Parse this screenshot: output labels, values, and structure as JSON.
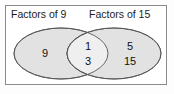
{
  "diagram": {
    "type": "venn-diagram",
    "title": "",
    "frame_border_color": "#8a8a8a",
    "background_color": "#ffffff",
    "sets": [
      {
        "id": "left",
        "label": "Factors of 9",
        "fill_color": "#e2e2e2",
        "stroke_color": "#555555",
        "exclusive_members": [
          "9"
        ]
      },
      {
        "id": "right",
        "label": "Factors of 15",
        "fill_color": "#e2e2e2",
        "stroke_color": "#555555",
        "exclusive_members": [
          "5",
          "15"
        ]
      }
    ],
    "intersection": {
      "fill_color": "#efefef",
      "members": [
        "1",
        "3"
      ]
    }
  },
  "regions": {
    "left_only": {
      "values": [
        "9"
      ],
      "positions": [
        {
          "x": 45,
          "y": 54
        }
      ]
    },
    "intersection": {
      "values": [
        "1",
        "3"
      ],
      "positions": [
        {
          "x": 88,
          "y": 47
        },
        {
          "x": 88,
          "y": 62
        }
      ]
    },
    "right_only": {
      "values": [
        "5",
        "15"
      ],
      "positions": [
        {
          "x": 130,
          "y": 47
        },
        {
          "x": 130,
          "y": 62
        }
      ]
    }
  }
}
